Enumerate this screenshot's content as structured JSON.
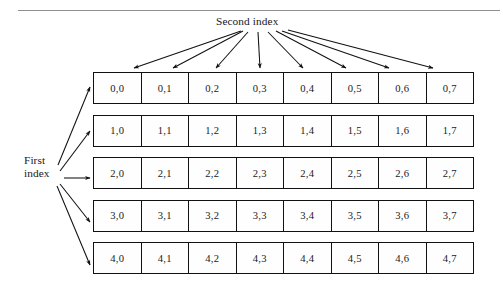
{
  "figure": {
    "kind": "diagram",
    "caption_rule": true,
    "labels": {
      "second_index": "Second index",
      "first_index_line1": "First",
      "first_index_line2": "index"
    },
    "colors": {
      "line": "#111114",
      "text": "#17171a",
      "rule": "#8f8f92",
      "background": "#ffffff",
      "cell_fill": "#fefefe"
    },
    "grid": {
      "row_count": 5,
      "column_count": 8,
      "rows": [
        {
          "index": 0,
          "cells": [
            "0,0",
            "0,1",
            "0,2",
            "0,3",
            "0,4",
            "0,5",
            "0,6",
            "0,7"
          ]
        },
        {
          "index": 1,
          "cells": [
            "1,0",
            "1,1",
            "1,2",
            "1,3",
            "1,4",
            "1,5",
            "1,6",
            "1,7"
          ]
        },
        {
          "index": 2,
          "cells": [
            "2,0",
            "2,1",
            "2,2",
            "2,3",
            "2,4",
            "2,5",
            "2,6",
            "2,7"
          ]
        },
        {
          "index": 3,
          "cells": [
            "3,0",
            "3,1",
            "3,2",
            "3,3",
            "3,4",
            "3,5",
            "3,6",
            "3,7"
          ]
        },
        {
          "index": 4,
          "cells": [
            "4,0",
            "4,1",
            "4,2",
            "4,3",
            "4,4",
            "4,5",
            "4,6",
            "4,7"
          ]
        }
      ]
    },
    "annotations": {
      "column_arrows": 8,
      "row_arrows": 5
    }
  }
}
